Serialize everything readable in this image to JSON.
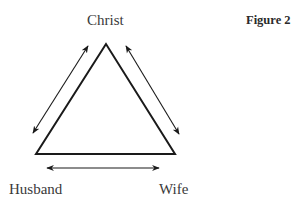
{
  "figure": {
    "title": "Figure 2",
    "nodes": {
      "top": "Christ",
      "bottom_left": "Husband",
      "bottom_right": "Wife"
    },
    "relations": [
      {
        "from": "Christ",
        "to": "Husband",
        "type": "bidirectional"
      },
      {
        "from": "Christ",
        "to": "Wife",
        "type": "bidirectional"
      },
      {
        "from": "Husband",
        "to": "Wife",
        "type": "bidirectional"
      }
    ],
    "colors": {
      "stroke": "#1a1a1a",
      "text": "#3a3a3a"
    }
  }
}
